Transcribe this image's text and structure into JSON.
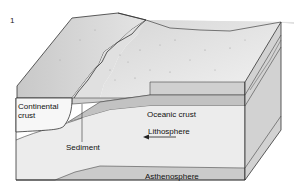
{
  "figure": {
    "number": "1",
    "type": "block-diagram"
  },
  "labels": {
    "continental_crust": "Continental\ncrust",
    "continental_line1": "Continental",
    "continental_line2": "crust",
    "sediment": "Sediment",
    "oceanic_crust": "Oceanic crust",
    "lithosphere": "Lithosphere",
    "asthenosphere": "Asthenosphere"
  },
  "annotations": {
    "lithosphere_arrow_direction": "left"
  },
  "colors": {
    "surface_light": "#ececec",
    "shelf": "#dcdcdc",
    "front_face": "#e6e6e6",
    "layer_band": "#c4c4c4",
    "side_face": "#cfcfcf",
    "continental_block": "#f7f7f7",
    "outline": "#333333"
  }
}
